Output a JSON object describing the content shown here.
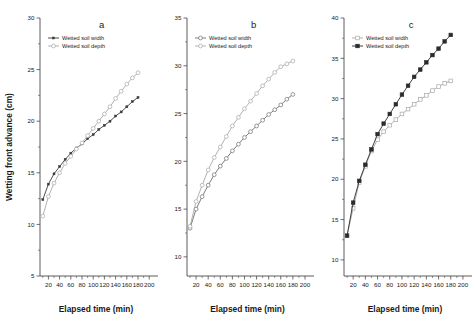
{
  "figure": {
    "shared_xlabel": "Elapsed time (min)",
    "shared_ylabel": "Wetting front advance (cm)",
    "xticks": [
      "20",
      "40",
      "60",
      "80",
      "100",
      "120",
      "140",
      "160",
      "180",
      "200"
    ],
    "xtick_values": [
      20,
      40,
      60,
      80,
      100,
      120,
      140,
      160,
      180,
      200
    ],
    "xlim": [
      5,
      205
    ]
  },
  "chart_data": [
    {
      "type": "line",
      "panel": "a",
      "title": "a",
      "xlabel": "Elapsed time (min)",
      "ylabel": "Wetting front advance (cm)",
      "xlim": [
        5,
        205
      ],
      "ylim": [
        5,
        30
      ],
      "xticks": [
        20,
        40,
        60,
        80,
        100,
        120,
        140,
        160,
        180,
        200
      ],
      "yticks": [
        5,
        10,
        15,
        20,
        25,
        30
      ],
      "ytick_labels": [
        "5",
        "10",
        "15",
        "20",
        "25",
        "30"
      ],
      "grid": false,
      "legend_position": "top-left",
      "x": [
        10,
        20,
        30,
        40,
        50,
        60,
        70,
        80,
        90,
        100,
        110,
        120,
        130,
        140,
        150,
        160,
        170,
        180
      ],
      "series": [
        {
          "name": "Wetted soil width",
          "marker": "small-filled-square",
          "color": "#3c3c3c",
          "values": [
            12.4,
            13.9,
            14.9,
            15.6,
            16.3,
            16.9,
            17.4,
            17.8,
            18.3,
            18.7,
            19.2,
            19.6,
            20.0,
            20.5,
            20.9,
            21.4,
            21.9,
            22.3
          ]
        },
        {
          "name": "Wetted soil depth",
          "marker": "open-circle",
          "color": "#a8a8a8",
          "values": [
            10.8,
            12.7,
            14.0,
            15.0,
            15.9,
            16.6,
            17.3,
            17.9,
            18.6,
            19.3,
            20.0,
            20.7,
            21.4,
            22.2,
            22.9,
            23.6,
            24.2,
            24.7
          ]
        }
      ]
    },
    {
      "type": "line",
      "panel": "b",
      "title": "b",
      "xlabel": "Elapsed time (min)",
      "ylabel": "Wetting front advance (cm)",
      "xlim": [
        5,
        205
      ],
      "ylim": [
        8,
        35
      ],
      "xticks": [
        20,
        40,
        60,
        80,
        100,
        120,
        140,
        160,
        180,
        200
      ],
      "yticks": [
        10,
        15,
        20,
        25,
        30,
        35
      ],
      "ytick_labels": [
        "10",
        "15",
        "20",
        "25",
        "30",
        "35"
      ],
      "grid": false,
      "legend_position": "top-left",
      "x": [
        10,
        20,
        30,
        40,
        50,
        60,
        70,
        80,
        90,
        100,
        110,
        120,
        130,
        140,
        150,
        160,
        170,
        180
      ],
      "series": [
        {
          "name": "Wetted soil width",
          "marker": "open-circle",
          "color": "#6e6e6e",
          "values": [
            13.0,
            15.0,
            16.3,
            17.5,
            18.6,
            19.5,
            20.3,
            21.1,
            21.8,
            22.5,
            23.1,
            23.7,
            24.3,
            24.9,
            25.4,
            25.9,
            26.5,
            27.0
          ]
        },
        {
          "name": "Wetted soil depth",
          "marker": "open-circle",
          "color": "#a8a8a8",
          "values": [
            13.2,
            15.8,
            17.5,
            19.1,
            20.4,
            21.5,
            22.6,
            23.7,
            24.6,
            25.5,
            26.3,
            27.1,
            27.9,
            28.6,
            29.3,
            29.9,
            30.2,
            30.5
          ]
        }
      ]
    },
    {
      "type": "line",
      "panel": "c",
      "title": "c",
      "xlabel": "Elapsed time (min)",
      "ylabel": "Wetting front advance (cm)",
      "xlim": [
        5,
        205
      ],
      "ylim": [
        8,
        40
      ],
      "xticks": [
        20,
        40,
        60,
        80,
        100,
        120,
        140,
        160,
        180,
        200
      ],
      "yticks": [
        10,
        15,
        20,
        25,
        30,
        35,
        40
      ],
      "ytick_labels": [
        "10",
        "15",
        "20",
        "25",
        "30",
        "35",
        "40"
      ],
      "grid": false,
      "legend_position": "top-left",
      "x": [
        10,
        20,
        30,
        40,
        50,
        60,
        70,
        80,
        90,
        100,
        110,
        120,
        130,
        140,
        150,
        160,
        170,
        180
      ],
      "series": [
        {
          "name": "Wetted soil width",
          "marker": "open-square",
          "color": "#a8a8a8",
          "values": [
            13.0,
            16.4,
            19.6,
            21.6,
            23.5,
            24.9,
            25.9,
            26.7,
            27.4,
            28.1,
            28.7,
            29.3,
            29.9,
            30.4,
            31.0,
            31.5,
            31.9,
            32.2
          ]
        },
        {
          "name": "Wetted soil depth",
          "marker": "filled-square",
          "color": "#2b2b2b",
          "values": [
            13.0,
            17.1,
            19.8,
            21.8,
            23.7,
            25.6,
            26.9,
            28.1,
            29.3,
            30.5,
            31.6,
            32.7,
            33.6,
            34.5,
            35.4,
            36.2,
            37.1,
            37.9
          ]
        }
      ]
    }
  ]
}
